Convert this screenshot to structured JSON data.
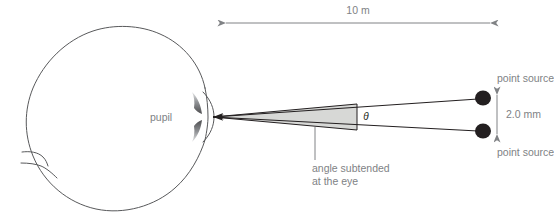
{
  "figure": {
    "background_color": "#ffffff",
    "ray_color": "#231f20",
    "dim_color": "#808285",
    "wedge_fill": "#d7d8d6",
    "outline_color": "#58595b"
  },
  "labels": {
    "distance": "10 m",
    "pupil": "pupil",
    "theta": "θ",
    "angle_caption_line1": "angle subtended",
    "angle_caption_line2": "at the eye",
    "point_source_top": "point source",
    "point_source_bottom": "point source",
    "separation": "2.0 mm"
  },
  "diagram_data": {
    "type": "optics-ray-diagram",
    "object_distance": {
      "value": 10,
      "unit": "m",
      "text": "10 m"
    },
    "source_separation": {
      "value": 2.0,
      "unit": "mm",
      "text": "2.0 mm"
    },
    "subtended_angle_symbol": "θ",
    "sources": [
      {
        "name": "point source",
        "position": "top"
      },
      {
        "name": "point source",
        "position": "bottom"
      }
    ],
    "elements": [
      "eyeball",
      "cornea",
      "iris",
      "pupil",
      "ray-top",
      "ray-bottom",
      "shaded-angle-wedge",
      "distance-dimension",
      "separation-dimension"
    ]
  }
}
